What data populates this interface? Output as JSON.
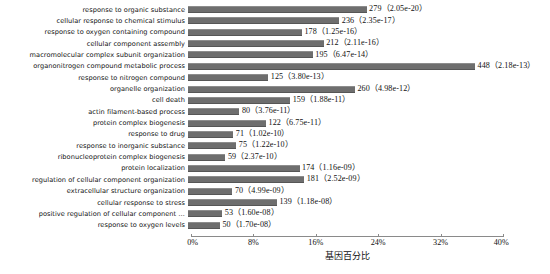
{
  "chart_data": {
    "type": "bar",
    "orientation": "horizontal",
    "title": "",
    "xlabel": "基因百分比",
    "ylabel": "",
    "xlim": [
      0,
      40
    ],
    "xunit": "%",
    "grid": false,
    "legend": null,
    "bar_color": "#6e6e6e",
    "xticks": [
      {
        "value": 0,
        "label": "0%"
      },
      {
        "value": 8,
        "label": "8%"
      },
      {
        "value": 16,
        "label": "16%"
      },
      {
        "value": 24,
        "label": "24%"
      },
      {
        "value": 32,
        "label": "32%"
      },
      {
        "value": 40,
        "label": "40%"
      }
    ],
    "categories": [
      "response to organic substance",
      "cellular response to chemical stimulus",
      "response to oxygen containing compound",
      "cellular component assembly",
      "macromolecular complex subunit organization",
      "organonitrogen compound metabolic process",
      "response to nitrogen compound",
      "organelle organization",
      "cell death",
      "actin filament-based process",
      "protein complex biogenesis",
      "response to drug",
      "response to inorganic substance",
      "ribonucleoprotein complex biogenesis",
      "protein localization",
      "regulation of cellular component organization",
      "extracellular structure organization",
      "cellular response to stress",
      "positive regulation of cellular component …",
      "response to oxygen levels"
    ],
    "counts": [
      279,
      236,
      178,
      212,
      195,
      448,
      125,
      260,
      159,
      80,
      122,
      71,
      75,
      59,
      174,
      181,
      70,
      139,
      53,
      50
    ],
    "pvalues": [
      "2.05e-20",
      "2.35e-17",
      "1.25e-16",
      "2.11e-16",
      "6.47e-14",
      "2.18e-13",
      "3.80e-13",
      "4.98e-12",
      "1.88e-11",
      "3.76e-11",
      "6.75e-11",
      "1.02e-10",
      "1.22e-10",
      "2.37e-10",
      "1.16e-09",
      "2.52e-09",
      "4.99e-09",
      "1.18e-08",
      "1.60e-08",
      "1.70e-08"
    ],
    "values": [
      22.9,
      19.4,
      14.6,
      17.4,
      16.0,
      36.8,
      10.3,
      21.4,
      13.1,
      6.6,
      10.0,
      5.8,
      6.2,
      4.8,
      14.3,
      14.9,
      5.7,
      11.4,
      4.4,
      4.1
    ],
    "labels": [
      "279（2.05e-20）",
      "236（2.35e-17）",
      "178（1.25e-16）",
      "212（2.11e-16）",
      "195（6.47e-14）",
      "448（2.18e-13）",
      "125（3.80e-13）",
      "260（4.98e-12）",
      "159（1.88e-11）",
      "80（3.76e-11）",
      "122（6.75e-11）",
      "71（1.02e-10）",
      "75（1.22e-10）",
      "59（2.37e-10）",
      "174（1.16e-09）",
      "181（2.52e-09）",
      "70（4.99e-09）",
      "139（1.18e-08）",
      "53（1.60e-08）",
      "50（1.70e-08）"
    ]
  },
  "caption": ""
}
